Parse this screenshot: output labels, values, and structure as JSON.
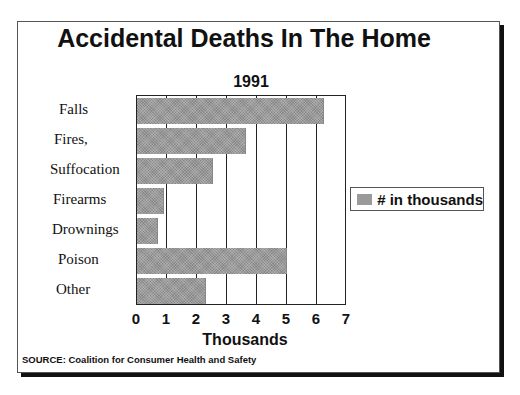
{
  "chart_data": {
    "type": "bar",
    "orientation": "horizontal",
    "title": "Accidental Deaths In The Home",
    "subtitle": "1991",
    "categories": [
      "Falls",
      "Fires,",
      "Suffocation",
      "Firearms",
      "Drownings",
      "Poison",
      "Other"
    ],
    "series": [
      {
        "name": "# in thousands",
        "values": [
          6.2,
          3.6,
          2.5,
          0.85,
          0.65,
          4.95,
          2.25
        ],
        "color": "#9a9a9a"
      }
    ],
    "xlabel": "Thousands",
    "ylabel": "",
    "xlim": [
      0,
      7
    ],
    "xticks": [
      "0",
      "1",
      "2",
      "3",
      "4",
      "5",
      "6",
      "7"
    ],
    "grid": true,
    "legend_position": "right",
    "source": "SOURCE: Coalition for Consumer Health and Safety"
  },
  "text": {
    "title": "Accidental Deaths In The Home",
    "subtitle": "1991",
    "xlabel": "Thousands",
    "legend": "# in thousands",
    "source": "SOURCE: Coalition for Consumer Health and Safety"
  }
}
